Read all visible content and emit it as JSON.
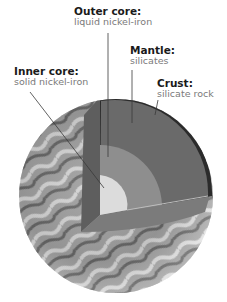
{
  "diagram": {
    "labels": [
      {
        "id": "outer-core",
        "title": "Outer core:",
        "description": "liquid nickel-iron"
      },
      {
        "id": "mantle",
        "title": "Mantle:",
        "description": "silicates"
      },
      {
        "id": "inner-core",
        "title": "Inner core:",
        "description": "solid nickel-iron"
      },
      {
        "id": "crust",
        "title": "Crust:",
        "description": "silicate rock"
      }
    ],
    "colors": {
      "crust": "#2b2b2b",
      "mantle": "#6a6a6a",
      "outer_core": "#8c8c8c",
      "inner_core": "#d8d8d8",
      "leader_line": "#3a3a3a"
    }
  }
}
